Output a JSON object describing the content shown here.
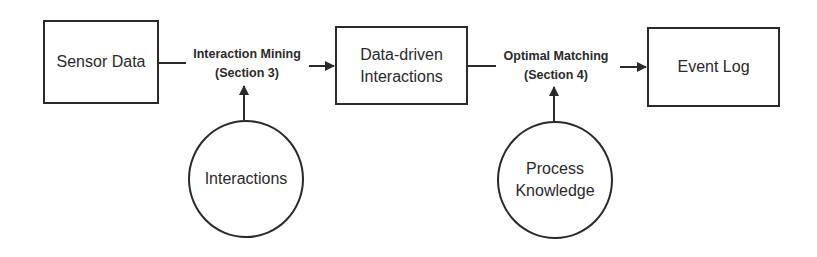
{
  "diagram": {
    "nodes": {
      "sensor_data": {
        "label": "Sensor Data",
        "shape": "rectangle"
      },
      "data_driven": {
        "line1": "Data-driven",
        "line2": "Interactions",
        "shape": "rectangle"
      },
      "event_log": {
        "label": "Event Log",
        "shape": "rectangle"
      },
      "interactions": {
        "label": "Interactions",
        "shape": "circle"
      },
      "process_knowledge": {
        "line1": "Process",
        "line2": "Knowledge",
        "shape": "circle"
      }
    },
    "edges": {
      "interaction_mining": {
        "line1": "Interaction Mining",
        "line2": "(Section 3)",
        "from": "Sensor Data",
        "to": "Data-driven Interactions",
        "input": "Interactions"
      },
      "optimal_matching": {
        "line1": "Optimal Matching",
        "line2": "(Section 4)",
        "from": "Data-driven Interactions",
        "to": "Event Log",
        "input": "Process Knowledge"
      }
    },
    "colors": {
      "stroke": "#2a2a2a",
      "background": "#ffffff"
    }
  }
}
